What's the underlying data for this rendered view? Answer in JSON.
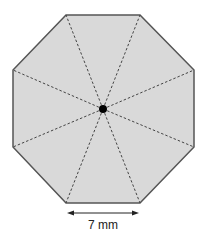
{
  "diagram": {
    "shape": "regular-octagon",
    "fill_color": "#d9d9d9",
    "stroke_color": "#555555",
    "center_dot_color": "#000000",
    "dashed_lines": "center-to-vertex",
    "side_label": "7 mm"
  }
}
